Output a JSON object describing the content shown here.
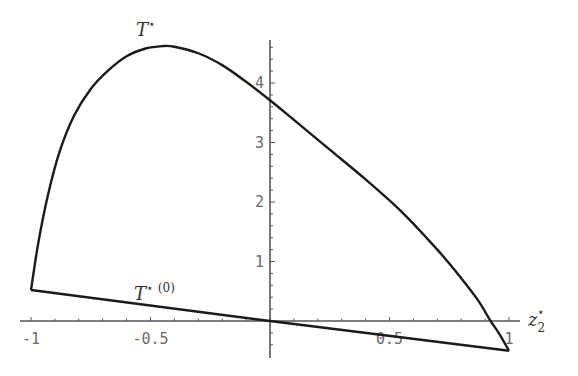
{
  "chart_data": {
    "type": "line",
    "title": "",
    "xlabel": "z2*",
    "ylabel": "",
    "xlim": [
      -1.05,
      1.15
    ],
    "ylim": [
      -0.6,
      4.75
    ],
    "grid": false,
    "x_ticks": [
      -1,
      -0.5,
      0.5,
      1
    ],
    "x_tick_labels": [
      "-1",
      "-0.5",
      "0.5",
      "1"
    ],
    "y_ticks": [
      1,
      2,
      3,
      4
    ],
    "y_tick_labels": [
      "1",
      "2",
      "3",
      "4"
    ],
    "series": [
      {
        "name": "T*",
        "label": "T",
        "label_sup": "⋆",
        "x": [
          -1.0,
          -0.97,
          -0.93,
          -0.88,
          -0.82,
          -0.75,
          -0.68,
          -0.6,
          -0.52,
          -0.45,
          -0.4,
          -0.3,
          -0.2,
          -0.1,
          0.0,
          0.1,
          0.25,
          0.4,
          0.55,
          0.7,
          0.8,
          0.87,
          0.92,
          0.96,
          1.0
        ],
        "y": [
          0.52,
          1.3,
          2.1,
          2.85,
          3.45,
          3.9,
          4.2,
          4.45,
          4.58,
          4.62,
          4.61,
          4.5,
          4.3,
          4.02,
          3.71,
          3.38,
          2.88,
          2.38,
          1.84,
          1.2,
          0.72,
          0.35,
          0.02,
          -0.22,
          -0.5
        ]
      },
      {
        "name": "T*(0)",
        "label": "T",
        "label_sup": "⋆ (0)",
        "x": [
          -1.0,
          0.0,
          1.0
        ],
        "y": [
          0.52,
          0.0,
          -0.5
        ]
      }
    ]
  },
  "labels": {
    "xaxis": "z",
    "xaxis_sub": "2",
    "xaxis_sup": "⋆"
  }
}
